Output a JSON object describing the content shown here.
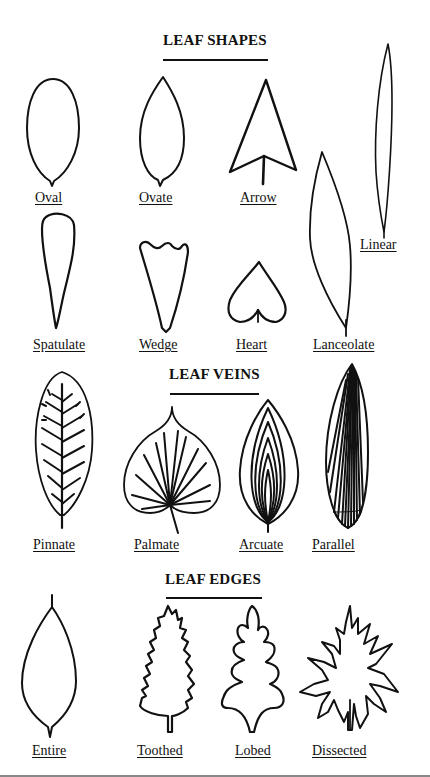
{
  "sections": {
    "shapes": {
      "title": "LEAF SHAPES",
      "items": [
        "Oval",
        "Ovate",
        "Arrow",
        "Linear",
        "Spatulate",
        "Wedge",
        "Heart",
        "Lanceolate"
      ]
    },
    "veins": {
      "title": "LEAF VEINS",
      "items": [
        "Pinnate",
        "Palmate",
        "Arcuate",
        "Parallel"
      ]
    },
    "edges": {
      "title": "LEAF EDGES",
      "items": [
        "Entire",
        "Toothed",
        "Lobed",
        "Dissected"
      ]
    }
  },
  "colors": {
    "ink": "#111111",
    "background": "#ffffff"
  }
}
